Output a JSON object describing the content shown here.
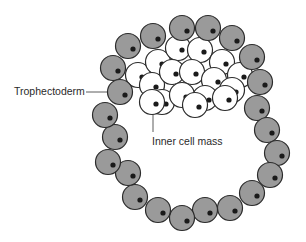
{
  "diagram": {
    "labels": {
      "trophectoderm": "Trophectoderm",
      "inner_cell_mass": "Inner cell mass"
    },
    "colors": {
      "trophectoderm_fill": "#9a9a9a",
      "icm_fill": "#ffffff",
      "outline": "#2b2b2b",
      "nucleus": "#1a1a1a"
    },
    "trophectoderm_cells": [
      [
        113,
        68
      ],
      [
        128,
        46
      ],
      [
        153,
        36
      ],
      [
        182,
        28
      ],
      [
        208,
        28
      ],
      [
        232,
        38
      ],
      [
        252,
        57
      ],
      [
        260,
        82
      ],
      [
        257,
        108
      ],
      [
        267,
        130
      ],
      [
        277,
        153
      ],
      [
        270,
        175
      ],
      [
        252,
        193
      ],
      [
        230,
        208
      ],
      [
        205,
        210
      ],
      [
        182,
        218
      ],
      [
        158,
        210
      ],
      [
        135,
        197
      ],
      [
        128,
        173
      ],
      [
        108,
        162
      ],
      [
        115,
        137
      ],
      [
        105,
        115
      ],
      [
        120,
        92
      ]
    ],
    "inner_cell_mass_cells": [
      [
        138,
        75
      ],
      [
        158,
        62
      ],
      [
        178,
        48
      ],
      [
        200,
        50
      ],
      [
        222,
        62
      ],
      [
        240,
        75
      ],
      [
        152,
        85
      ],
      [
        172,
        72
      ],
      [
        192,
        72
      ],
      [
        214,
        80
      ],
      [
        232,
        90
      ],
      [
        162,
        102
      ],
      [
        182,
        95
      ],
      [
        205,
        98
      ],
      [
        225,
        98
      ],
      [
        152,
        102
      ],
      [
        195,
        105
      ]
    ]
  }
}
